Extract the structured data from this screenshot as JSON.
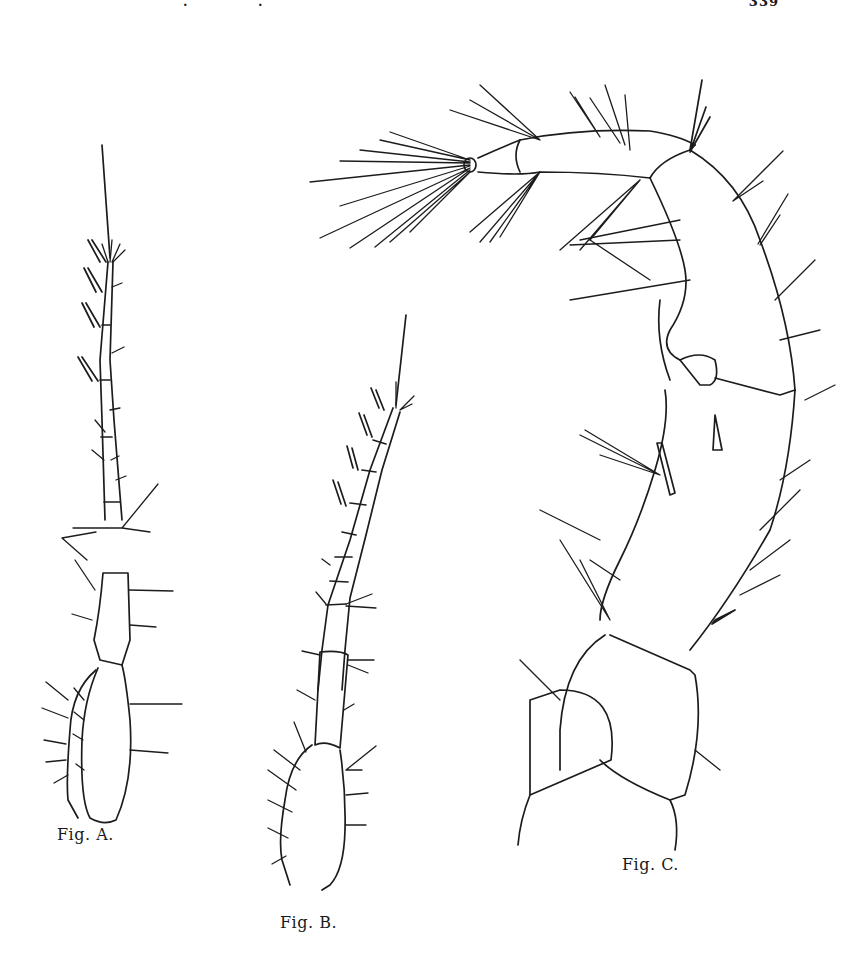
{
  "page": {
    "header": {
      "running_head_fragments": [
        ".",
        "."
      ],
      "page_number": "339"
    },
    "figures": [
      {
        "id": "A",
        "caption": "Fig. A.",
        "subject": "antenna (slender, multi-segmented with aesthetascs)"
      },
      {
        "id": "B",
        "caption": "Fig. B.",
        "subject": "antenna (curved, multi-segmented with aesthetascs)"
      },
      {
        "id": "C",
        "caption": "Fig. C.",
        "subject": "appendage with setose distal segments"
      }
    ],
    "colors": {
      "ink": "#1c1c1c",
      "paper": "#ffffff"
    }
  }
}
